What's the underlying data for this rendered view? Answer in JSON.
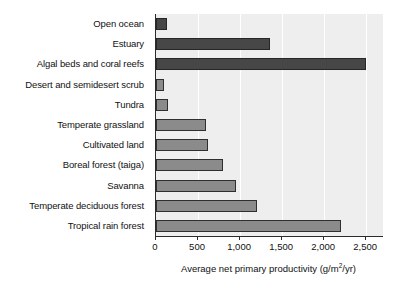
{
  "chart_data": {
    "type": "bar",
    "orientation": "horizontal",
    "title": "",
    "xlabel": "Average net primary productivity (g/m2/yr)",
    "xlabel_parts": {
      "before": "Average net primary productivity (g/m",
      "superscript": "2",
      "after": "/yr)"
    },
    "ylabel": "",
    "xlim": [
      0,
      2700
    ],
    "xticks": [
      0,
      500,
      1000,
      1500,
      2000,
      2500
    ],
    "xtick_labels": [
      "0",
      "500",
      "1,000",
      "1,500",
      "2,000",
      "2,500"
    ],
    "grid": true,
    "grid_axis": "x",
    "legend": "none",
    "plot_background": "#eeeeee",
    "categories": [
      "Open ocean",
      "Estuary",
      "Algal beds and coral reefs",
      "Desert and semidesert scrub",
      "Tundra",
      "Temperate grassland",
      "Cultivated land",
      "Boreal forest (taiga)",
      "Savanna",
      "Temperate deciduous forest",
      "Tropical rain forest"
    ],
    "values": [
      125,
      1350,
      2500,
      90,
      140,
      600,
      620,
      800,
      950,
      1200,
      2200
    ],
    "bar_colors": [
      "#474747",
      "#474747",
      "#474747",
      "#8b8b8b",
      "#8b8b8b",
      "#8b8b8b",
      "#8b8b8b",
      "#8b8b8b",
      "#8b8b8b",
      "#8b8b8b",
      "#8b8b8b"
    ],
    "bars": [
      {
        "label": "Open ocean",
        "value": 125,
        "shade": "dark"
      },
      {
        "label": "Estuary",
        "value": 1350,
        "shade": "dark"
      },
      {
        "label": "Algal beds and coral reefs",
        "value": 2500,
        "shade": "dark"
      },
      {
        "label": "Desert and semidesert scrub",
        "value": 90,
        "shade": "light"
      },
      {
        "label": "Tundra",
        "value": 140,
        "shade": "light"
      },
      {
        "label": "Temperate grassland",
        "value": 600,
        "shade": "light"
      },
      {
        "label": "Cultivated land",
        "value": 620,
        "shade": "light"
      },
      {
        "label": "Boreal forest (taiga)",
        "value": 800,
        "shade": "light"
      },
      {
        "label": "Savanna",
        "value": 950,
        "shade": "light"
      },
      {
        "label": "Temperate deciduous forest",
        "value": 1200,
        "shade": "light"
      },
      {
        "label": "Tropical rain forest",
        "value": 2200,
        "shade": "light"
      }
    ]
  }
}
